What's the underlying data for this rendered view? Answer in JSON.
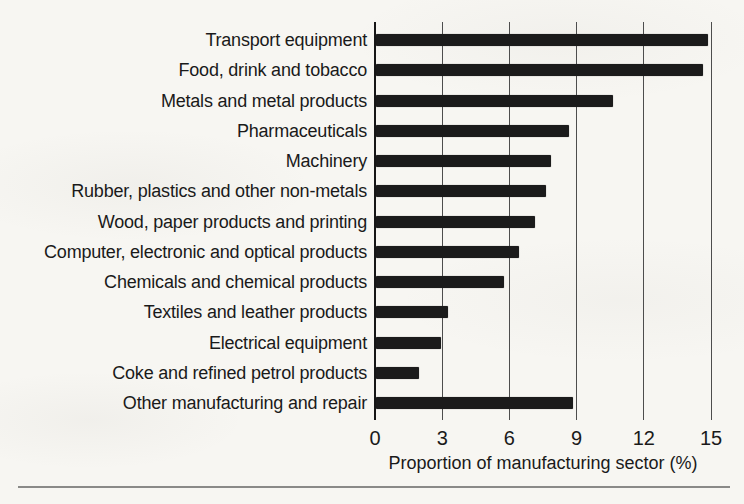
{
  "page": {
    "background": "#f7f6f2",
    "divider_rule_color": "#8a8a88"
  },
  "chart_data": {
    "type": "bar",
    "orientation": "horizontal",
    "title": "",
    "xlabel": "Proportion of manufacturing sector (%)",
    "ylabel": "",
    "xlim": [
      0,
      15
    ],
    "xticks": [
      "0",
      "3",
      "6",
      "9",
      "12",
      "15"
    ],
    "grid": "vertical gridlines at every x tick, full plot height",
    "legend": "none",
    "bar_color": "#1b1b1b",
    "gridline_color": "#4d4d4d",
    "axis_line_color": "#161616",
    "text_color": "#1a1a1a",
    "categories": [
      "Transport equipment",
      "Food, drink and tobacco",
      "Metals and metal products",
      "Pharmaceuticals",
      "Machinery",
      "Rubber, plastics and other non-metals",
      "Wood, paper products and printing",
      "Computer, electronic and optical products",
      "Chemicals and chemical products",
      "Textiles and leather products",
      "Electrical equipment",
      "Coke and refined petrol products",
      "Other manufacturing and repair"
    ],
    "values": [
      14.8,
      14.6,
      10.6,
      8.6,
      7.8,
      7.6,
      7.1,
      6.4,
      5.7,
      3.2,
      2.9,
      1.9,
      8.8
    ]
  }
}
